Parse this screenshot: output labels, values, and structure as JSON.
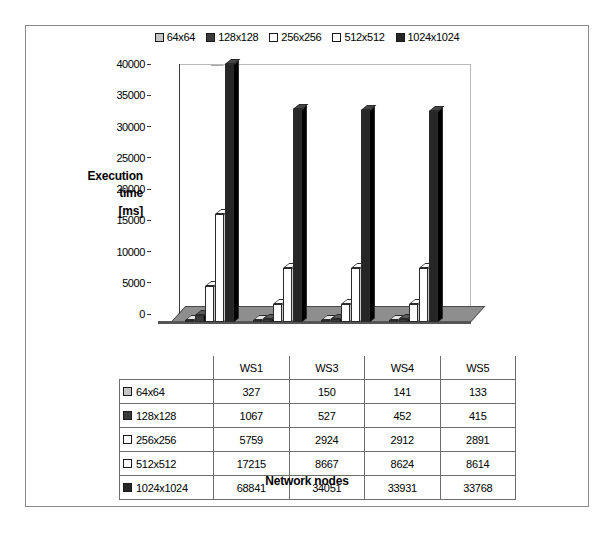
{
  "chart_data": {
    "type": "bar",
    "title": "",
    "xlabel": "Network nodes",
    "ylabel": "Execution time [ms]",
    "ylabel_lines": [
      "Execution",
      "time",
      "[ms]"
    ],
    "categories": [
      "WS1",
      "WS3",
      "WS4",
      "WS5"
    ],
    "ylim": [
      0,
      40000
    ],
    "yticks": [
      0,
      5000,
      10000,
      15000,
      20000,
      25000,
      30000,
      35000,
      40000
    ],
    "ytick_labels": [
      "0",
      "5000",
      "10000",
      "15000",
      "20000",
      "25000",
      "30000",
      "35000",
      "40000"
    ],
    "grid": false,
    "legend_position": "top-center",
    "threed": true,
    "series": [
      {
        "name": "64x64",
        "values": [
          327,
          150,
          141,
          133
        ],
        "color": "#c6c6c6"
      },
      {
        "name": "128x128",
        "values": [
          1067,
          527,
          452,
          415
        ],
        "color": "#3a3a3a"
      },
      {
        "name": "256x256",
        "values": [
          5759,
          2924,
          2912,
          2891
        ],
        "color": "#ffffff"
      },
      {
        "name": "512x512",
        "values": [
          17215,
          8667,
          8624,
          8614
        ],
        "color": "#ffffff"
      },
      {
        "name": "1024x1024",
        "values": [
          68841,
          34051,
          33931,
          33768
        ],
        "color": "#262626"
      }
    ]
  },
  "table": {
    "header_row": [
      "",
      "WS1",
      "WS3",
      "WS4",
      "WS5"
    ],
    "rows": [
      {
        "label": "64x64",
        "values": [
          "327",
          "150",
          "141",
          "133"
        ]
      },
      {
        "label": "128x128",
        "values": [
          "1067",
          "527",
          "452",
          "415"
        ]
      },
      {
        "label": "256x256",
        "values": [
          "5759",
          "2924",
          "2912",
          "2891"
        ]
      },
      {
        "label": "512x512",
        "values": [
          "17215",
          "8667",
          "8624",
          "8614"
        ]
      },
      {
        "label": "1024x1024",
        "values": [
          "68841",
          "34051",
          "33931",
          "33768"
        ]
      }
    ]
  }
}
